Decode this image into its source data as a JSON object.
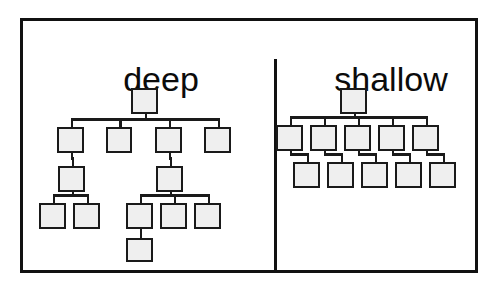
{
  "figure": {
    "background_color": "#ffffff",
    "frame_color": "#111111",
    "node_fill": "#efefef",
    "node_stroke": "#1a1a1a",
    "divider_label": "panel-divider"
  },
  "panels": [
    {
      "id": "deep",
      "title": "deep",
      "node_count": 15,
      "depth_levels": 5,
      "description": "deep hierarchy tree diagram"
    },
    {
      "id": "shallow",
      "title": "shallow",
      "node_count": 11,
      "depth_levels": 3,
      "description": "shallow hierarchy tree diagram"
    }
  ],
  "deep_tree": {
    "nodes": [
      {
        "id": "d-root",
        "level": 1,
        "x": 131,
        "y": 88,
        "w": 27,
        "h": 26
      },
      {
        "id": "d-2a",
        "level": 2,
        "x": 57,
        "y": 127,
        "w": 27,
        "h": 26
      },
      {
        "id": "d-2b",
        "level": 2,
        "x": 106,
        "y": 127,
        "w": 26,
        "h": 26
      },
      {
        "id": "d-2c",
        "level": 2,
        "x": 155,
        "y": 127,
        "w": 27,
        "h": 26
      },
      {
        "id": "d-2d",
        "level": 2,
        "x": 204,
        "y": 127,
        "w": 27,
        "h": 26
      },
      {
        "id": "d-3a",
        "level": 3,
        "x": 58,
        "y": 166,
        "w": 27,
        "h": 26
      },
      {
        "id": "d-3b",
        "level": 3,
        "x": 156,
        "y": 166,
        "w": 27,
        "h": 26
      },
      {
        "id": "d-4a",
        "level": 4,
        "x": 39,
        "y": 203,
        "w": 27,
        "h": 26
      },
      {
        "id": "d-4b",
        "level": 4,
        "x": 73,
        "y": 203,
        "w": 27,
        "h": 26
      },
      {
        "id": "d-4c",
        "level": 4,
        "x": 126,
        "y": 203,
        "w": 27,
        "h": 26
      },
      {
        "id": "d-4d",
        "level": 4,
        "x": 160,
        "y": 203,
        "w": 27,
        "h": 26
      },
      {
        "id": "d-4e",
        "level": 4,
        "x": 194,
        "y": 203,
        "w": 27,
        "h": 26
      },
      {
        "id": "d-5a",
        "level": 5,
        "x": 126,
        "y": 238,
        "w": 27,
        "h": 24
      }
    ],
    "edges": [
      {
        "from": "d-root",
        "to": "d-2a"
      },
      {
        "from": "d-root",
        "to": "d-2b"
      },
      {
        "from": "d-root",
        "to": "d-2c"
      },
      {
        "from": "d-root",
        "to": "d-2d"
      },
      {
        "from": "d-2a",
        "to": "d-3a"
      },
      {
        "from": "d-2c",
        "to": "d-3b"
      },
      {
        "from": "d-3a",
        "to": "d-4a"
      },
      {
        "from": "d-3a",
        "to": "d-4b"
      },
      {
        "from": "d-3b",
        "to": "d-4c"
      },
      {
        "from": "d-3b",
        "to": "d-4d"
      },
      {
        "from": "d-3b",
        "to": "d-4e"
      },
      {
        "from": "d-4c",
        "to": "d-5a"
      }
    ]
  },
  "shallow_tree": {
    "nodes": [
      {
        "id": "s-root",
        "level": 1,
        "x": 340,
        "y": 88,
        "w": 27,
        "h": 26
      },
      {
        "id": "s-2a",
        "level": 2,
        "x": 276,
        "y": 125,
        "w": 27,
        "h": 26
      },
      {
        "id": "s-2b",
        "level": 2,
        "x": 310,
        "y": 125,
        "w": 27,
        "h": 26
      },
      {
        "id": "s-2c",
        "level": 2,
        "x": 344,
        "y": 125,
        "w": 27,
        "h": 26
      },
      {
        "id": "s-2d",
        "level": 2,
        "x": 378,
        "y": 125,
        "w": 27,
        "h": 26
      },
      {
        "id": "s-2e",
        "level": 2,
        "x": 412,
        "y": 125,
        "w": 27,
        "h": 26
      },
      {
        "id": "s-3a",
        "level": 3,
        "x": 293,
        "y": 162,
        "w": 27,
        "h": 26
      },
      {
        "id": "s-3b",
        "level": 3,
        "x": 327,
        "y": 162,
        "w": 27,
        "h": 26
      },
      {
        "id": "s-3c",
        "level": 3,
        "x": 361,
        "y": 162,
        "w": 27,
        "h": 26
      },
      {
        "id": "s-3d",
        "level": 3,
        "x": 395,
        "y": 162,
        "w": 27,
        "h": 26
      },
      {
        "id": "s-3e",
        "level": 3,
        "x": 429,
        "y": 162,
        "w": 27,
        "h": 26
      }
    ],
    "edges": [
      {
        "from": "s-root",
        "to": "s-2a"
      },
      {
        "from": "s-root",
        "to": "s-2b"
      },
      {
        "from": "s-root",
        "to": "s-2c"
      },
      {
        "from": "s-root",
        "to": "s-2d"
      },
      {
        "from": "s-root",
        "to": "s-2e"
      },
      {
        "from": "s-2a",
        "to": "s-3a"
      },
      {
        "from": "s-2b",
        "to": "s-3b"
      },
      {
        "from": "s-2c",
        "to": "s-3c"
      },
      {
        "from": "s-2d",
        "to": "s-3d"
      },
      {
        "from": "s-2e",
        "to": "s-3e"
      }
    ]
  }
}
